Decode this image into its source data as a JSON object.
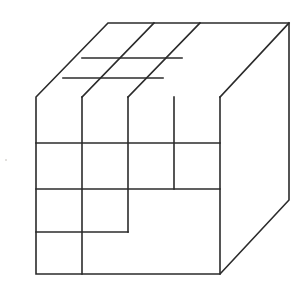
{
  "figure": {
    "type": "line-drawing",
    "background_color": "#ffffff",
    "stroke_color": "#2b2b2b",
    "stroke_width": 1.6,
    "canvas": {
      "width": 299,
      "height": 285
    }
  },
  "geometry": {
    "vertices": {
      "front_top_left": [
        36,
        97
      ],
      "front_top_right": [
        220,
        97
      ],
      "front_bottom_left": [
        36,
        274
      ],
      "front_bottom_right": [
        220,
        274
      ],
      "back_top_left": [
        108,
        23
      ],
      "back_top_right": [
        289,
        23
      ],
      "back_bottom_right": [
        289,
        200
      ]
    },
    "outline_path": "M36,97 L108,23 L289,23 L289,200 L220,274 L36,274 Z",
    "hidden_vertical_edge": [
      220,
      97,
      220,
      274
    ],
    "top_face_right_edge": [
      220,
      97,
      289,
      23
    ],
    "front_face": {
      "x_divisions": [
        82,
        128,
        174
      ],
      "y_divisions": [
        143,
        189,
        232
      ],
      "segments": [
        {
          "name": "v-col1-full",
          "x1": 82,
          "y1": 97,
          "x2": 82,
          "y2": 274
        },
        {
          "name": "v-col2-upper",
          "x1": 128,
          "y1": 97,
          "x2": 128,
          "y2": 232
        },
        {
          "name": "v-col3-upper",
          "x1": 174,
          "y1": 97,
          "x2": 174,
          "y2": 189
        },
        {
          "name": "h-row1-full",
          "x1": 36,
          "y1": 143,
          "x2": 220,
          "y2": 143
        },
        {
          "name": "h-row2-full",
          "x1": 36,
          "y1": 189,
          "x2": 220,
          "y2": 189
        },
        {
          "name": "h-row3-left",
          "x1": 36,
          "y1": 232,
          "x2": 128,
          "y2": 232
        }
      ]
    },
    "top_face": {
      "segments": [
        {
          "name": "top-ridge-front",
          "x1": 82,
          "y1": 97,
          "x2": 154,
          "y2": 23
        },
        {
          "name": "top-ridge-back",
          "x1": 128,
          "y1": 97,
          "x2": 200,
          "y2": 23
        },
        {
          "name": "top-cross-near",
          "x1": 63,
          "y1": 78,
          "x2": 163,
          "y2": 78
        },
        {
          "name": "top-cross-far",
          "x1": 82,
          "y1": 58,
          "x2": 182,
          "y2": 58
        }
      ]
    }
  },
  "labels": {
    "figure_caption": "Isometric cube divided into a 4 x 4 block grid with a recessed step"
  },
  "speckles": [
    {
      "x": 176,
      "y": 76,
      "r": 1.1
    },
    {
      "x": 185,
      "y": 74,
      "r": 0.9
    },
    {
      "x": 195,
      "y": 77,
      "r": 0.8
    },
    {
      "x": 205,
      "y": 75,
      "r": 1.0
    },
    {
      "x": 214,
      "y": 78,
      "r": 0.9
    },
    {
      "x": 168,
      "y": 80,
      "r": 0.7
    },
    {
      "x": 6,
      "y": 160,
      "r": 1.0
    }
  ]
}
